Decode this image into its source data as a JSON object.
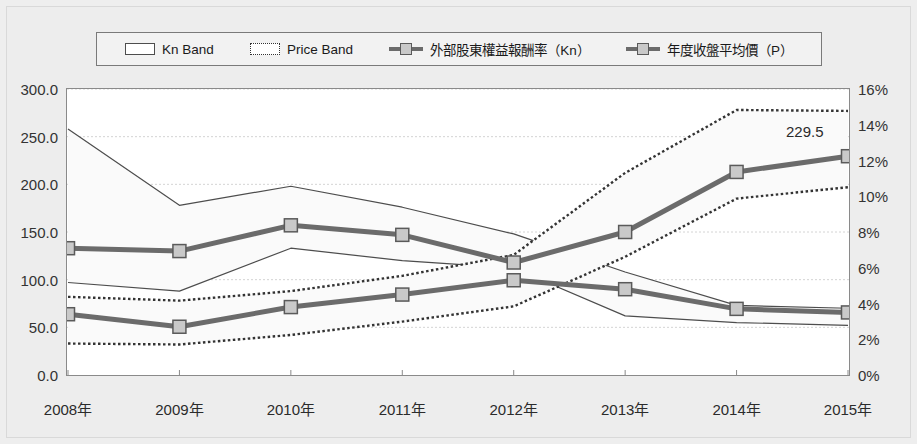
{
  "legend": {
    "items": [
      {
        "label": "Kn Band",
        "swatch": "band-solid-swatch"
      },
      {
        "label": "Price Band",
        "swatch": "band-dotted-swatch"
      },
      {
        "label": "外部股東權益報酬率（Kn）",
        "swatch": "line-marker-swatch"
      },
      {
        "label": "年度收盤平均價（P）",
        "swatch": "line-marker-swatch"
      }
    ]
  },
  "annotation": {
    "value_label": "229.5"
  },
  "colors": {
    "background": "#ededed",
    "plot_background": "#ffffff",
    "series_line": "#6b6b6b",
    "marker_fill": "#c9c9c9",
    "marker_stroke": "#5a5a5a",
    "kn_band_stroke": "#4d4d4d",
    "price_band_stroke": "#333333",
    "gridline": "#d4d4d4",
    "axis": "#8a8a8a",
    "text": "#2b2b2b"
  },
  "chart_data": {
    "type": "line",
    "title": "",
    "xlabel": "",
    "ylabel": "",
    "grid": true,
    "legend_position": "top",
    "categories": [
      "2008年",
      "2009年",
      "2010年",
      "2011年",
      "2012年",
      "2013年",
      "2014年",
      "2015年"
    ],
    "axes": {
      "left": {
        "label": "",
        "ylim": [
          0.0,
          300.0
        ],
        "ticks": [
          0.0,
          50.0,
          100.0,
          150.0,
          200.0,
          250.0,
          300.0
        ],
        "ticklabels": [
          "0.0",
          "50.0",
          "100.0",
          "150.0",
          "200.0",
          "250.0",
          "300.0"
        ]
      },
      "right": {
        "label": "",
        "ylim": [
          0,
          16
        ],
        "ticks": [
          0,
          2,
          4,
          6,
          8,
          10,
          12,
          14,
          16
        ],
        "ticklabels": [
          "0%",
          "2%",
          "4%",
          "6%",
          "8%",
          "10%",
          "12%",
          "14%",
          "16%"
        ]
      }
    },
    "series": [
      {
        "name": "Kn Band",
        "kind": "band",
        "axis": "left",
        "style": "solid",
        "upper": [
          258.0,
          178.0,
          198.0,
          176.0,
          148.0,
          108.0,
          73.0,
          70.0
        ],
        "lower": [
          97.0,
          88.0,
          133.0,
          120.0,
          112.0,
          62.0,
          55.0,
          52.0
        ]
      },
      {
        "name": "Price Band",
        "kind": "band",
        "axis": "left",
        "style": "dotted",
        "upper": [
          82.0,
          78.0,
          88.0,
          104.0,
          126.0,
          212.0,
          278.0,
          277.0
        ],
        "lower": [
          33.0,
          32.0,
          42.0,
          56.0,
          72.0,
          124.0,
          185.0,
          197.0
        ]
      },
      {
        "name": "外部股東權益報酬率（Kn）",
        "kind": "line",
        "axis": "right",
        "unit": "%",
        "values": [
          3.4,
          2.7,
          3.8,
          4.5,
          5.3,
          4.8,
          3.7,
          3.5
        ]
      },
      {
        "name": "年度收盤平均價（P）",
        "kind": "line",
        "axis": "left",
        "values": [
          133.0,
          130.0,
          157.0,
          147.0,
          118.0,
          150.0,
          213.0,
          229.5
        ]
      }
    ],
    "annotations": [
      {
        "text": "229.5",
        "series": "年度收盤平均價（P）",
        "category": "2015年",
        "value": 229.5
      }
    ]
  }
}
